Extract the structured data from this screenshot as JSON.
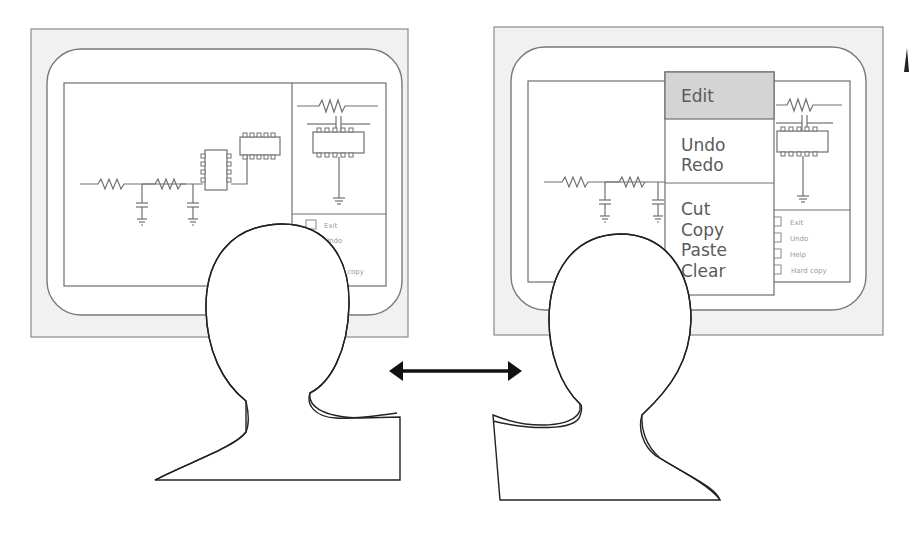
{
  "figure": {
    "left_panel": {
      "name": "screen-without-menu",
      "palette_options": [
        "Exit",
        "Undo",
        "Help",
        "Hard copy"
      ],
      "visible_partial_labels": {
        "exit": "Exit",
        "undo": "Undo",
        "hard_copy_fragment": "l copy"
      }
    },
    "right_panel": {
      "name": "screen-with-edit-menu",
      "edit_menu": {
        "title": "Edit",
        "groups": [
          [
            "Undo",
            "Redo"
          ],
          [
            "Cut",
            "Copy",
            "Paste",
            "Clear"
          ]
        ]
      },
      "palette_options": [
        "Exit",
        "Undo",
        "Help",
        "Hard copy"
      ]
    },
    "connector": {
      "type": "double-headed-arrow"
    },
    "colors": {
      "frame_fill": "#f1f1f1",
      "line": "#707070",
      "menu_header": "#d4d4d4",
      "text": "#5a5a5a",
      "outline": "#222222"
    }
  }
}
